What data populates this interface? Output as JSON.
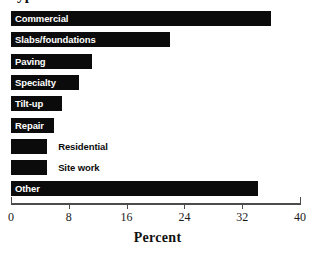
{
  "chart_data": {
    "type": "bar",
    "orientation": "horizontal",
    "title": "Types of concrete work",
    "title_clipped": true,
    "xlabel": "Percent",
    "ylabel": "",
    "xlim": [
      0,
      40
    ],
    "xticks": [
      "0",
      "8",
      "16",
      "24",
      "32",
      "40"
    ],
    "xtick_values": [
      0,
      8,
      16,
      24,
      32,
      40
    ],
    "grid": false,
    "legend": "none",
    "bar_color": "#0b0b0b",
    "axis_color": "#4c4c4c",
    "categories": [
      "Commercial",
      "Slabs/foundations",
      "Paving",
      "Specialty",
      "Tilt-up",
      "Repair",
      "Residential",
      "Site work",
      "Other"
    ],
    "values": [
      36,
      22,
      11.2,
      9.4,
      7,
      6,
      5,
      5,
      34.2
    ],
    "bars": [
      {
        "label": "Commercial",
        "value": 36,
        "label_placement": "inside"
      },
      {
        "label": "Slabs/foundations",
        "value": 22,
        "label_placement": "inside"
      },
      {
        "label": "Paving",
        "value": 11.2,
        "label_placement": "inside"
      },
      {
        "label": "Specialty",
        "value": 9.4,
        "label_placement": "inside"
      },
      {
        "label": "Tilt-up",
        "value": 7,
        "label_placement": "inside"
      },
      {
        "label": "Repair",
        "value": 6,
        "label_placement": "inside"
      },
      {
        "label": "Residential",
        "value": 5,
        "label_placement": "outside"
      },
      {
        "label": "Site work",
        "value": 5,
        "label_placement": "outside"
      },
      {
        "label": "Other",
        "value": 34.2,
        "label_placement": "inside"
      }
    ]
  }
}
